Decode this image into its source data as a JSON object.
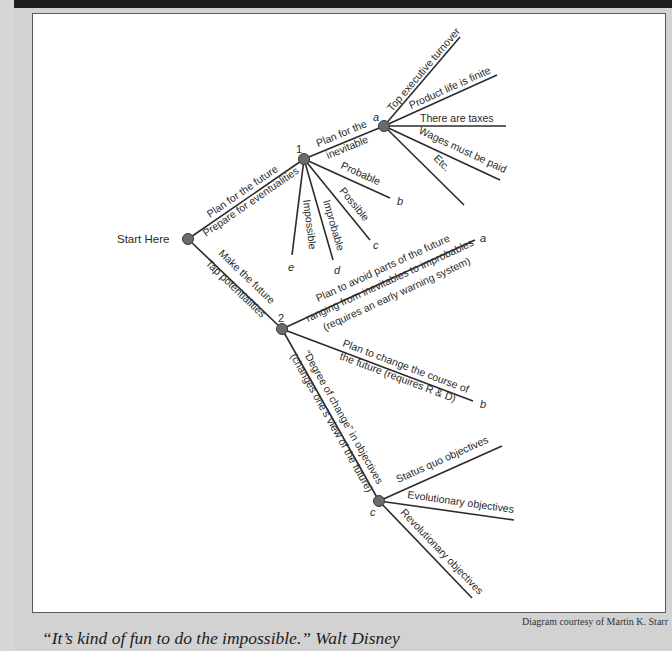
{
  "diagram": {
    "start": "Start Here",
    "branch_1": {
      "number": "1",
      "edge_label_top": "Plan for the future",
      "edge_label_bottom": "Prepare for eventualities",
      "inevitable_edge_line1": "Plan for the",
      "inevitable_edge_line2": "inevitable",
      "node_a": {
        "letter": "a",
        "leaves": [
          "Top executive turnover",
          "Product life is finite",
          "There are taxes",
          "Wages must be paid",
          "Etc."
        ]
      },
      "probable": {
        "label": "Probable",
        "letter": "b"
      },
      "possible": {
        "label": "Possible",
        "letter": "c"
      },
      "improbable": {
        "label": "Improbable",
        "letter": "d"
      },
      "impossible": {
        "label": "Impossible",
        "letter": "e"
      }
    },
    "branch_2": {
      "number": "2",
      "edge_label_top": "Make the future",
      "edge_label_bottom": "Tap potentialities",
      "a": {
        "letter": "a",
        "line1": "Plan to avoid parts of the future",
        "line2": "ranging from inevitables to improbables",
        "line3": "(requires an early warning system)"
      },
      "b": {
        "letter": "b",
        "line1": "Plan to change the course of",
        "line2": "the future (requires R & D)"
      },
      "c": {
        "letter": "c",
        "edge_line1": "“Degree of change” in objectives",
        "edge_line2": "(changes one’s view of the future)",
        "leaves": [
          "Status quo objectives",
          "Evolutionary objectives",
          "Revolutionary objectives"
        ]
      }
    }
  },
  "credit": "Diagram courtesy of Martin K. Starr",
  "quote": "“It’s kind of fun to do the impossible.” Walt Disney"
}
